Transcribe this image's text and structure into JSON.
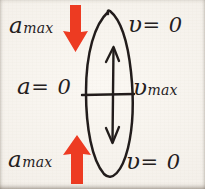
{
  "figure": {
    "kind": "handwritten-physics-diagram",
    "medium": "pen on paper",
    "background_color": "#f3efe9",
    "ink_color": "#24201d",
    "accent_color": "#ed3b24",
    "topic": "simple harmonic motion: acceleration and velocity at extremes and equilibrium"
  },
  "labels": {
    "top_left": {
      "symbol": "a",
      "subscript": "max",
      "text": "amax"
    },
    "top_right": {
      "symbol": "υ",
      "relation": "= 0",
      "text": "υ = 0"
    },
    "middle_left": {
      "symbol": "a",
      "relation": "= 0",
      "text": "a = 0"
    },
    "middle_right": {
      "symbol": "υ",
      "subscript": "max",
      "text": "υmax"
    },
    "bottom_left": {
      "symbol": "a",
      "subscript": "max",
      "text": "amax"
    },
    "bottom_right": {
      "symbol": "υ",
      "relation": "= 0",
      "text": "υ = 0"
    }
  },
  "shapes": {
    "oval": {
      "name": "oscillation-path-ellipse",
      "cx": 109,
      "cy": 96,
      "rx": 23,
      "ry": 84,
      "stroke": "#231f1c"
    },
    "midline": {
      "name": "equilibrium-horizontal-line",
      "x1": 82,
      "x2": 134,
      "y": 95,
      "stroke": "#231f1c"
    },
    "inner_arrow": {
      "name": "velocity-double-arrow",
      "x": 113,
      "y_top": 46,
      "y_bottom": 144,
      "heads": "both",
      "stroke": "#231f1c"
    },
    "red_arrow_top": {
      "name": "acceleration-arrow-down",
      "direction": "down",
      "color": "#ed3b24",
      "x": 75,
      "y_top": 6,
      "y_bottom": 52
    },
    "red_arrow_bottom": {
      "name": "acceleration-arrow-up",
      "direction": "up",
      "color": "#ed3b24",
      "x": 77,
      "y_top": 136,
      "y_bottom": 184
    }
  }
}
